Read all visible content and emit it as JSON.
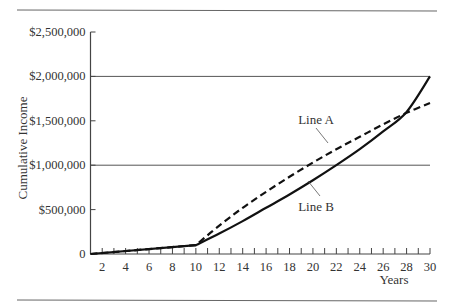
{
  "chart_data": {
    "type": "line",
    "title": "",
    "xlabel": "Years",
    "ylabel": "Cumulative Income",
    "xlim": [
      1,
      30
    ],
    "ylim": [
      0,
      2500000
    ],
    "x_ticks": [
      2,
      4,
      6,
      8,
      10,
      12,
      14,
      16,
      18,
      20,
      22,
      24,
      26,
      28,
      30
    ],
    "x_minor_tick_step": 1,
    "y_ticks": [
      0,
      500000,
      1000000,
      1500000,
      2000000,
      2500000
    ],
    "y_tick_labels": [
      "0",
      "$500,000",
      "$1,000,000",
      "$1,500,000",
      "$2,000,000",
      "$2,500,000"
    ],
    "gridlines_y": [
      1000000,
      2000000
    ],
    "legend": "inline labels",
    "series": [
      {
        "name": "Line A",
        "style": "dashed",
        "x": [
          1,
          10,
          12,
          14,
          16,
          18,
          20,
          22,
          24,
          26,
          28,
          30
        ],
        "values": [
          0,
          100000,
          320000,
          520000,
          700000,
          870000,
          1030000,
          1180000,
          1320000,
          1460000,
          1590000,
          1700000
        ]
      },
      {
        "name": "Line B",
        "style": "solid",
        "x": [
          1,
          10,
          12,
          14,
          16,
          18,
          20,
          22,
          24,
          26,
          28,
          30
        ],
        "values": [
          0,
          100000,
          230000,
          370000,
          520000,
          670000,
          830000,
          1000000,
          1180000,
          1380000,
          1600000,
          2000000
        ]
      }
    ],
    "annotations": [
      {
        "text": "Line A",
        "x": 20.8,
        "y": 1400000
      },
      {
        "text": "Line B",
        "x": 21.2,
        "y": 600000
      }
    ]
  },
  "labels": {
    "xlabel": "Years",
    "ylabel": "Cumulative Income",
    "lineA": "Line A",
    "lineB": "Line B"
  }
}
